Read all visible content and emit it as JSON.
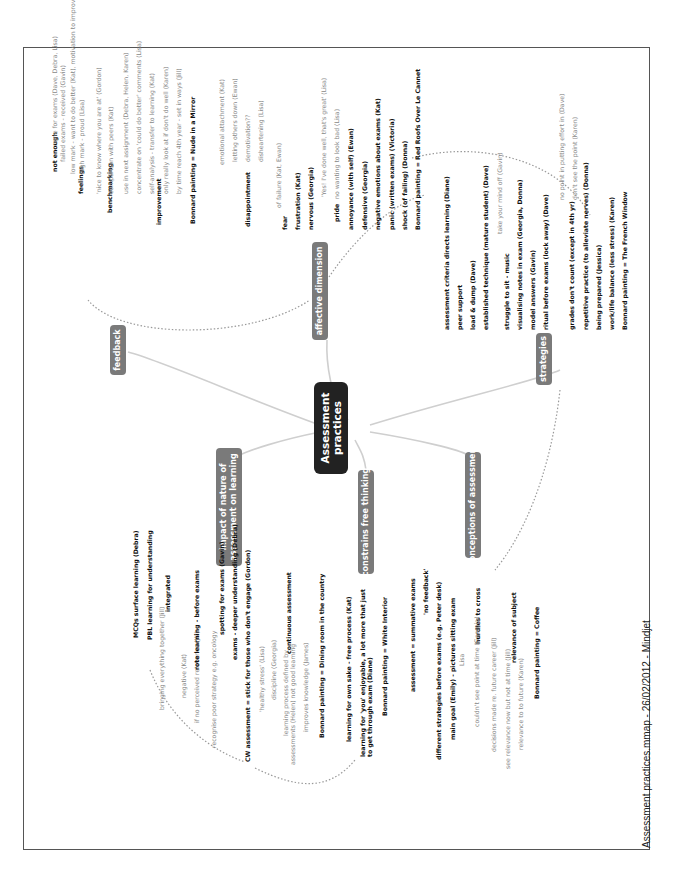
{
  "title": "Assessment practices",
  "footer": "Assessment practices.mmap - 26/02/2012 - Mindjet",
  "colors": {
    "central": "#222222",
    "branch": "#7a7a7a",
    "line": "#cccccc",
    "link": "#999999"
  },
  "branches": {
    "feedback": {
      "label": "feedback",
      "items": {
        "not_enough": "not enough",
        "none_for_exams": "none for exams (Dave, Debra, Lisa)",
        "failed_exams": "failed exams - received (Gavin)",
        "feelings": "feelings",
        "low_mark": "low mark - want to do better (Kat), motivation to improve (Helen)",
        "high_mark": "high mark - proud (Lisa)",
        "benchmarking": "benchmarking",
        "nice_to_know": "'nice to know where you are at' (Gordon)",
        "comparison": "comparison with peers (Kat)",
        "improvement": "improvement",
        "use_next": "use in next assignment (Debra, Helen, Karen)",
        "concentrate": "concentrate on 'could do better' comments (Lisa)",
        "self_analysis": "self-analysis - transfer to learning (Kat)",
        "only_look": "only really look at if don't do well (Karen)",
        "by_time": "by time reach 4th year - set in ways (Jill)",
        "bonnard": "Bonnard painting = Nude in a Mirror"
      }
    },
    "affective": {
      "label": "affective dimension",
      "items": {
        "emotional": "emotional attachment (Kat)",
        "letting": "letting others down (Ewan)",
        "demotivation": "demotivation??",
        "disheartening": "disheartening (Lisa)",
        "disappointment": "disappointment",
        "of_failure": "of failure (Kat, Ewan)",
        "fear": "fear",
        "frustration": "frustration (Kat)",
        "nervous": "nervous (Georgia)",
        "yes": "'Yes! I've done well, that's great' (Lisa)",
        "pride": "pride",
        "no_wanting": "no wanting to look bad (Lisa)",
        "annoyance": "annoyance (with self) (Ewan)",
        "defensive": "defensive (Georgia)",
        "negative": "negative emotions about exams (Kat)",
        "panic": "panic (written exams) (Victoria)",
        "shock": "shock (of failing) (Donna)",
        "bonnard": "Bonnard painting = Red Roofs Over Le Cannet"
      }
    },
    "strategies": {
      "label": "strategies",
      "items": {
        "criteria": "assessment criteria directs learning (Diane)",
        "peer": "peer support",
        "load": "load & dump (Dave)",
        "established": "established technique (mature student) (Dave)",
        "take_mind": "take your mind off (Gavin)",
        "struggle": "struggle to sit - music",
        "visualising": "visualising notes in exam (Georgia, Donna)",
        "model": "model answers (Gavin)",
        "ritual": "ritual before exams (lock away) (Dave)",
        "no_point": "no point in putting effort in (Dave)",
        "dont_see": "don't see the point (Karen)",
        "grades": "grades don't count (except in 4th yr)",
        "repetitive": "repetitive practice (to alleviate nerves) (Donna)",
        "prepared": "being prepared (Jessica)",
        "work_life": "work/life balance (less stress) (Karen)",
        "bonnard": "Bonnard painting = The French Window"
      }
    },
    "impact": {
      "label_line1": "impact of nature of",
      "label_line2": "assessment on learning",
      "items": {
        "mcqs": "MCQs surface learning (Debra)",
        "pbl": "PBL learning for understanding",
        "bringing": "bringing everything together (Jill)",
        "integrated": "integrated",
        "negative": "negative (Kat)",
        "no_relevance": "if no perceived relevance (Jill)",
        "rote": "rote learning - before exams",
        "recognise": "recognise poor strategy e.g. oncology",
        "spotting": "spotting for exams (Gavin)",
        "deeper": "exams - deeper understanding (Debra)",
        "cw": "CW assessment = stick for those who don't engage (Gordon)",
        "healthy": "'healthy stress' (Lisa)",
        "discipline": "discipline (Georgia)",
        "process1": "learning process defined by",
        "process2": "assessments (Helen) not good learning",
        "continuous": "continuous assessment",
        "improves": "improves knowledge (James)",
        "bonnard": "Bonnard painting = Dining room in the country"
      }
    },
    "constrains": {
      "label": "constrains free thinking",
      "items": {
        "own_sake": "learning for own sake - free process (Kat)",
        "you1": "learning for 'you' enjoyable, a lot more that just",
        "you2": "to get through exam (Diane)",
        "bonnard": "Bonnard painting = White Interior"
      }
    },
    "conceptions": {
      "label": "conceptions of assessment",
      "items": {
        "summative": "assessment = summative exams",
        "no_feedback": "'no feedback'",
        "different": "different strategies before exams (e.g. Peter desk)",
        "main_goal": "main goal (Emily) - pictures sitting exam",
        "lisa": "Lisa",
        "hurdles": "hurdles to cross",
        "couldnt": "couldn't see point at time (Georgia)",
        "decisions": "decisions made re. future career (Jill)",
        "see_relevance": "see relevance now but not at time (Jill)",
        "relevance_subject": "relevance of subject",
        "relevance_future": "relevance to to future (Karen)",
        "bonnard": "Bonnard painting = Coffee"
      }
    }
  }
}
